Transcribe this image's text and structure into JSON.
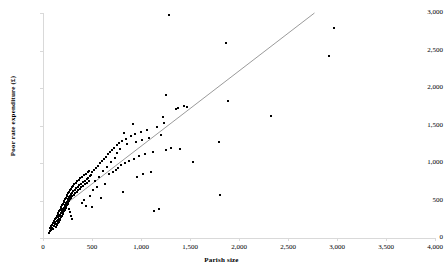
{
  "chart_data": {
    "type": "scatter",
    "title": "",
    "xlabel": "Parish size",
    "ylabel": "Poor rate expenditure (£)",
    "xlim": [
      0,
      4000
    ],
    "ylim": [
      0,
      3000
    ],
    "xticks": [
      0,
      500,
      1000,
      1500,
      2000,
      2500,
      3000,
      3500,
      4000
    ],
    "yticks": [
      0,
      500,
      1000,
      1500,
      2000,
      2500,
      3000
    ],
    "xtick_labels": [
      "0",
      "500",
      "1,000",
      "1,500",
      "2,000",
      "2,500",
      "3,000",
      "3,500",
      "4,000"
    ],
    "ytick_labels": [
      "0",
      "500",
      "1,000",
      "1,500",
      "2,000",
      "2,500",
      "3,000"
    ],
    "grid": false,
    "legend": false,
    "marker": "square",
    "marker_color": "#000000",
    "marker_size": 2,
    "axis_color": "#d9d9d9",
    "background": "#ffffff",
    "series": [
      {
        "name": "Parishes",
        "points": [
          [
            60,
            70
          ],
          [
            70,
            95
          ],
          [
            75,
            130
          ],
          [
            80,
            110
          ],
          [
            85,
            160
          ],
          [
            90,
            140
          ],
          [
            95,
            175
          ],
          [
            100,
            120
          ],
          [
            105,
            205
          ],
          [
            110,
            165
          ],
          [
            112,
            230
          ],
          [
            118,
            185
          ],
          [
            120,
            250
          ],
          [
            125,
            210
          ],
          [
            128,
            150
          ],
          [
            130,
            265
          ],
          [
            135,
            190
          ],
          [
            138,
            300
          ],
          [
            142,
            225
          ],
          [
            145,
            170
          ],
          [
            148,
            320
          ],
          [
            150,
            240
          ],
          [
            152,
            285
          ],
          [
            155,
            200
          ],
          [
            158,
            340
          ],
          [
            160,
            260
          ],
          [
            163,
            215
          ],
          [
            165,
            360
          ],
          [
            168,
            290
          ],
          [
            170,
            235
          ],
          [
            172,
            380
          ],
          [
            175,
            310
          ],
          [
            178,
            255
          ],
          [
            180,
            400
          ],
          [
            182,
            330
          ],
          [
            185,
            275
          ],
          [
            188,
            420
          ],
          [
            190,
            350
          ],
          [
            192,
            295
          ],
          [
            195,
            440
          ],
          [
            198,
            370
          ],
          [
            200,
            315
          ],
          [
            202,
            460
          ],
          [
            205,
            390
          ],
          [
            208,
            335
          ],
          [
            210,
            480
          ],
          [
            212,
            405
          ],
          [
            215,
            355
          ],
          [
            218,
            500
          ],
          [
            220,
            425
          ],
          [
            222,
            375
          ],
          [
            225,
            520
          ],
          [
            228,
            445
          ],
          [
            230,
            395
          ],
          [
            232,
            540
          ],
          [
            235,
            465
          ],
          [
            238,
            415
          ],
          [
            240,
            560
          ],
          [
            242,
            485
          ],
          [
            245,
            435
          ],
          [
            248,
            580
          ],
          [
            250,
            505
          ],
          [
            252,
            455
          ],
          [
            255,
            600
          ],
          [
            258,
            525
          ],
          [
            260,
            475
          ],
          [
            262,
            620
          ],
          [
            265,
            545
          ],
          [
            268,
            495
          ],
          [
            270,
            385
          ],
          [
            272,
            345
          ],
          [
            275,
            640
          ],
          [
            278,
            565
          ],
          [
            280,
            515
          ],
          [
            282,
            290
          ],
          [
            285,
            660
          ],
          [
            288,
            585
          ],
          [
            290,
            535
          ],
          [
            292,
            250
          ],
          [
            295,
            680
          ],
          [
            298,
            605
          ],
          [
            300,
            555
          ],
          [
            305,
            700
          ],
          [
            310,
            625
          ],
          [
            315,
            575
          ],
          [
            320,
            720
          ],
          [
            325,
            645
          ],
          [
            330,
            595
          ],
          [
            335,
            740
          ],
          [
            340,
            665
          ],
          [
            345,
            615
          ],
          [
            350,
            760
          ],
          [
            355,
            685
          ],
          [
            360,
            635
          ],
          [
            365,
            780
          ],
          [
            370,
            705
          ],
          [
            375,
            655
          ],
          [
            380,
            800
          ],
          [
            385,
            725
          ],
          [
            390,
            675
          ],
          [
            395,
            470
          ],
          [
            400,
            820
          ],
          [
            405,
            745
          ],
          [
            410,
            695
          ],
          [
            415,
            505
          ],
          [
            420,
            840
          ],
          [
            425,
            765
          ],
          [
            430,
            715
          ],
          [
            435,
            430
          ],
          [
            440,
            860
          ],
          [
            445,
            785
          ],
          [
            450,
            735
          ],
          [
            455,
            880
          ],
          [
            460,
            805
          ],
          [
            465,
            755
          ],
          [
            470,
            900
          ],
          [
            475,
            825
          ],
          [
            480,
            560
          ],
          [
            490,
            845
          ],
          [
            500,
            420
          ],
          [
            505,
            875
          ],
          [
            510,
            640
          ],
          [
            520,
            905
          ],
          [
            530,
            760
          ],
          [
            540,
            935
          ],
          [
            550,
            680
          ],
          [
            560,
            965
          ],
          [
            570,
            820
          ],
          [
            580,
            995
          ],
          [
            590,
            540
          ],
          [
            600,
            1025
          ],
          [
            610,
            890
          ],
          [
            620,
            1055
          ],
          [
            630,
            720
          ],
          [
            640,
            1085
          ],
          [
            650,
            950
          ],
          [
            660,
            1115
          ],
          [
            670,
            850
          ],
          [
            680,
            1145
          ],
          [
            690,
            1010
          ],
          [
            700,
            1175
          ],
          [
            710,
            880
          ],
          [
            720,
            1205
          ],
          [
            730,
            1070
          ],
          [
            740,
            910
          ],
          [
            750,
            1235
          ],
          [
            760,
            1130
          ],
          [
            770,
            940
          ],
          [
            780,
            1265
          ],
          [
            790,
            1190
          ],
          [
            800,
            970
          ],
          [
            810,
            1295
          ],
          [
            820,
            620
          ],
          [
            830,
            1405
          ],
          [
            840,
            1000
          ],
          [
            850,
            1325
          ],
          [
            860,
            1250
          ],
          [
            880,
            1030
          ],
          [
            900,
            1355
          ],
          [
            920,
            1515
          ],
          [
            930,
            1060
          ],
          [
            940,
            1385
          ],
          [
            950,
            1280
          ],
          [
            960,
            820
          ],
          [
            980,
            1090
          ],
          [
            1000,
            1415
          ],
          [
            1010,
            1310
          ],
          [
            1020,
            850
          ],
          [
            1040,
            1120
          ],
          [
            1060,
            1445
          ],
          [
            1080,
            1340
          ],
          [
            1100,
            880
          ],
          [
            1120,
            1150
          ],
          [
            1130,
            355
          ],
          [
            1160,
            1475
          ],
          [
            1180,
            390
          ],
          [
            1200,
            1370
          ],
          [
            1220,
            1620
          ],
          [
            1230,
            1540
          ],
          [
            1250,
            1910
          ],
          [
            1260,
            1180
          ],
          [
            1290,
            2975
          ],
          [
            1310,
            1205
          ],
          [
            1360,
            1720
          ],
          [
            1380,
            1735
          ],
          [
            1400,
            1190
          ],
          [
            1440,
            1755
          ],
          [
            1470,
            1745
          ],
          [
            1530,
            1020
          ],
          [
            1800,
            1280
          ],
          [
            1810,
            580
          ],
          [
            1870,
            2595
          ],
          [
            1890,
            1825
          ],
          [
            2330,
            1630
          ],
          [
            2920,
            2425
          ],
          [
            2970,
            2805
          ]
        ]
      }
    ],
    "trendline": {
      "type": "linear",
      "color": "#808080",
      "x_start": 220,
      "y_start": 440,
      "x_end": 2770,
      "y_end": 3000
    }
  }
}
